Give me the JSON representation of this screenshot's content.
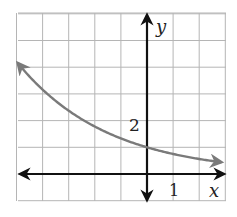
{
  "chart_data": {
    "type": "line",
    "title": "",
    "xlabel": "x",
    "ylabel": "y",
    "xlim": [
      -5,
      3
    ],
    "ylim": [
      -1,
      6
    ],
    "grid": true,
    "grid_step": 1,
    "tick_labels": {
      "x": "1",
      "y": "2"
    },
    "series": [
      {
        "name": "exponential decay curve",
        "function": "y = (3/4)^x",
        "x": [
          -5,
          -4,
          -3,
          -2,
          -1,
          0,
          1,
          2,
          3
        ],
        "values": [
          4.21,
          3.16,
          2.37,
          1.78,
          1.33,
          1,
          0.75,
          0.56,
          0.42
        ],
        "color": "#7a7a7a",
        "arrows_both_ends": true
      }
    ],
    "axis_color": "#111111",
    "grid_color": "#b5b5b5"
  },
  "labels": {
    "x_axis": "x",
    "y_axis": "y",
    "x_tick": "1",
    "y_tick": "2"
  }
}
